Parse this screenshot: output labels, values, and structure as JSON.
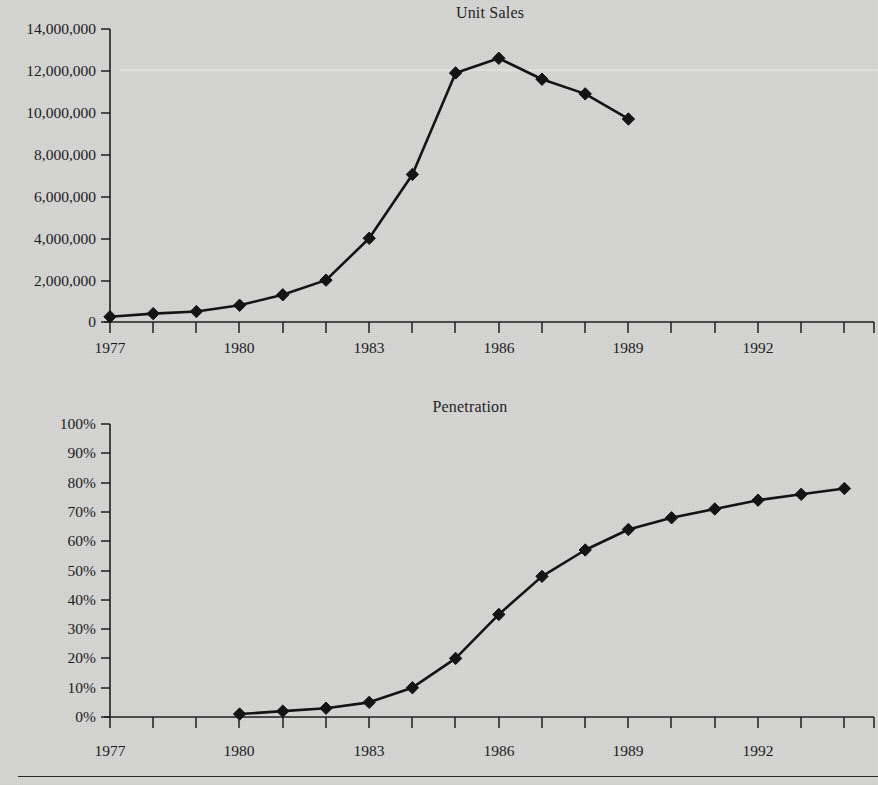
{
  "page": {
    "background_color": "#d7d7d5",
    "ink_color": "#141414",
    "bottom_rule": "horizontal-rule"
  },
  "charts": [
    {
      "id": "unit-sales",
      "title": "Unit Sales",
      "y_ticks": [
        "14,000,000",
        "12,000,000",
        "10,000,000",
        "8,000,000",
        "6,000,000",
        "4,000,000",
        "2,000,000",
        "0"
      ],
      "x_ticks": [
        "1977",
        "1980",
        "1983",
        "1986",
        "1989",
        "1992"
      ]
    },
    {
      "id": "penetration",
      "title": "Penetration",
      "y_ticks": [
        "100%",
        "90%",
        "80%",
        "70%",
        "60%",
        "50%",
        "40%",
        "30%",
        "20%",
        "10%",
        "0%"
      ],
      "x_ticks": [
        "1977",
        "1980",
        "1983",
        "1986",
        "1989",
        "1992"
      ]
    }
  ],
  "chart_data": [
    {
      "type": "line",
      "title": "Unit Sales",
      "xlabel": "",
      "ylabel": "",
      "xlim": [
        1976.5,
        1994.5
      ],
      "ylim": [
        0,
        14000000
      ],
      "ytick_values": [
        0,
        2000000,
        4000000,
        6000000,
        8000000,
        10000000,
        12000000,
        14000000
      ],
      "ytick_labels": [
        "0",
        "2,000,000",
        "4,000,000",
        "6,000,000",
        "8,000,000",
        "10,000,000",
        "12,000,000",
        "14,000,000"
      ],
      "xtick_values": [
        1977,
        1980,
        1983,
        1986,
        1989,
        1992
      ],
      "xtick_labels": [
        "1977",
        "1980",
        "1983",
        "1986",
        "1989",
        "1992"
      ],
      "xtick_minor_step": 1,
      "grid": false,
      "legend": null,
      "marker": "diamond",
      "x": [
        1977,
        1978,
        1979,
        1980,
        1981,
        1982,
        1983,
        1984,
        1985,
        1986,
        1987,
        1988,
        1989
      ],
      "values": [
        250000,
        400000,
        500000,
        800000,
        1300000,
        2000000,
        4000000,
        7050000,
        11900000,
        12600000,
        11600000,
        10900000,
        9700000
      ],
      "series": [
        {
          "name": "Unit Sales",
          "points": [
            {
              "x": 1977,
              "y": 250000
            },
            {
              "x": 1978,
              "y": 400000
            },
            {
              "x": 1979,
              "y": 500000
            },
            {
              "x": 1980,
              "y": 800000
            },
            {
              "x": 1981,
              "y": 1300000
            },
            {
              "x": 1982,
              "y": 2000000
            },
            {
              "x": 1983,
              "y": 4000000
            },
            {
              "x": 1984,
              "y": 7050000
            },
            {
              "x": 1985,
              "y": 11900000
            },
            {
              "x": 1986,
              "y": 12600000
            },
            {
              "x": 1987,
              "y": 11600000
            },
            {
              "x": 1988,
              "y": 10900000
            },
            {
              "x": 1989,
              "y": 9700000
            }
          ]
        }
      ]
    },
    {
      "type": "line",
      "title": "Penetration",
      "xlabel": "",
      "ylabel": "",
      "xlim": [
        1976.5,
        1994.5
      ],
      "ylim": [
        0,
        100
      ],
      "yunit": "%",
      "ytick_values": [
        0,
        10,
        20,
        30,
        40,
        50,
        60,
        70,
        80,
        90,
        100
      ],
      "ytick_labels": [
        "0%",
        "10%",
        "20%",
        "30%",
        "40%",
        "50%",
        "60%",
        "70%",
        "80%",
        "90%",
        "100%"
      ],
      "xtick_values": [
        1977,
        1980,
        1983,
        1986,
        1989,
        1992
      ],
      "xtick_labels": [
        "1977",
        "1980",
        "1983",
        "1986",
        "1989",
        "1992"
      ],
      "xtick_minor_step": 1,
      "grid": false,
      "legend": null,
      "marker": "diamond",
      "x": [
        1980,
        1981,
        1982,
        1983,
        1984,
        1985,
        1986,
        1987,
        1988,
        1989,
        1990,
        1991,
        1992,
        1993,
        1994
      ],
      "values": [
        1,
        2,
        3,
        5,
        10,
        20,
        35,
        48,
        57,
        64,
        68,
        71,
        74,
        76,
        78
      ],
      "series": [
        {
          "name": "Penetration",
          "points": [
            {
              "x": 1980,
              "y": 1
            },
            {
              "x": 1981,
              "y": 2
            },
            {
              "x": 1982,
              "y": 3
            },
            {
              "x": 1983,
              "y": 5
            },
            {
              "x": 1984,
              "y": 10
            },
            {
              "x": 1985,
              "y": 20
            },
            {
              "x": 1986,
              "y": 35
            },
            {
              "x": 1987,
              "y": 48
            },
            {
              "x": 1988,
              "y": 57
            },
            {
              "x": 1989,
              "y": 64
            },
            {
              "x": 1990,
              "y": 68
            },
            {
              "x": 1991,
              "y": 71
            },
            {
              "x": 1992,
              "y": 74
            },
            {
              "x": 1993,
              "y": 76
            },
            {
              "x": 1994,
              "y": 78
            }
          ]
        }
      ]
    }
  ]
}
